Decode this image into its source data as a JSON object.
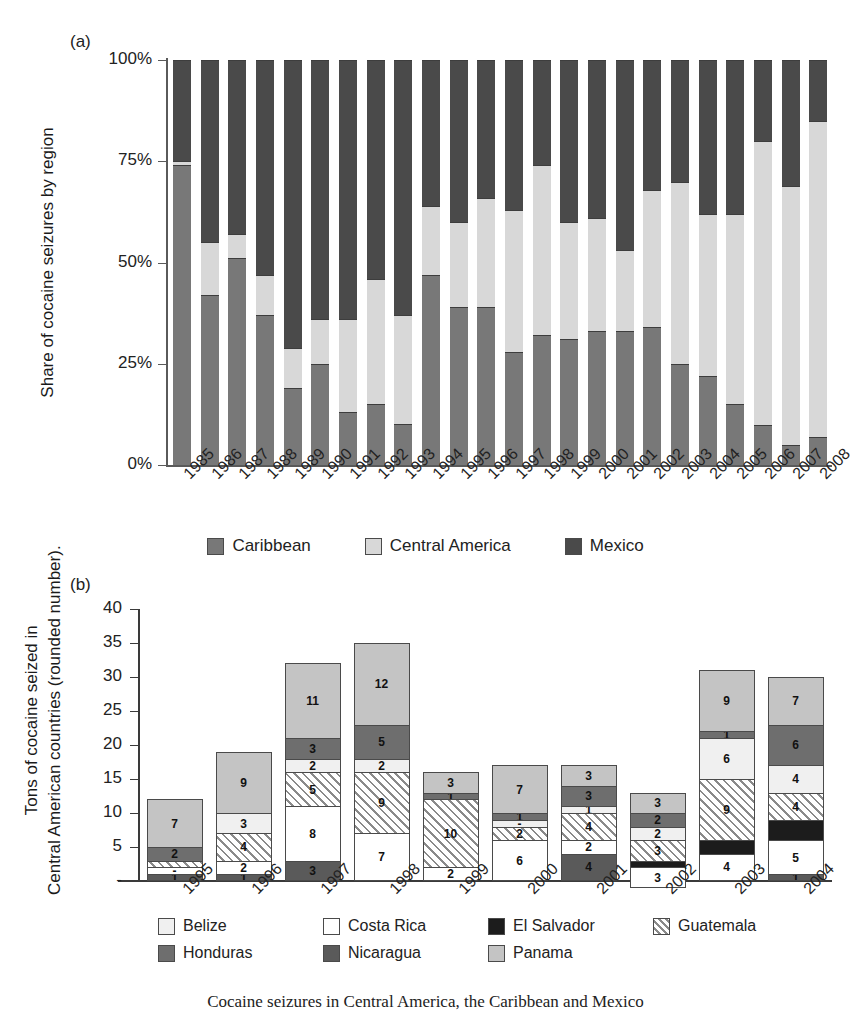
{
  "panel_a": {
    "letter": "(a)",
    "ylabel": "Share of cocaine seizures by region",
    "yticks": [
      "100%",
      "75%",
      "50%",
      "25%",
      "0%"
    ],
    "legend": [
      {
        "label": "Caribbean",
        "color": "#787878"
      },
      {
        "label": "Central America",
        "color": "#d8d8d8"
      },
      {
        "label": "Mexico",
        "color": "#4a4a4a"
      }
    ]
  },
  "panel_b": {
    "letter": "(b)",
    "ylabel_line1": "Tons of cocaine seized in",
    "ylabel_line2": "Central American countries (rounded number).",
    "yticks": [
      "40",
      "35",
      "30",
      "25",
      "20",
      "15",
      "10",
      "5",
      "-"
    ],
    "legend_row1": [
      {
        "label": "Belize",
        "color": "#f0f0f0"
      },
      {
        "label": "Costa Rica",
        "color": "#ffffff"
      },
      {
        "label": "El Salvador",
        "color": "#1c1c1c"
      },
      {
        "label": "Guatemala",
        "color": "hatch"
      }
    ],
    "legend_row2": [
      {
        "label": "Honduras",
        "color": "#6e6e6e"
      },
      {
        "label": "Nicaragua",
        "color": "#5a5a5a"
      },
      {
        "label": "Panama",
        "color": "#c4c4c4"
      }
    ]
  },
  "caption": "Cocaine seizures in Central America, the Caribbean and Mexico",
  "chart_data": [
    {
      "type": "bar",
      "id": "panel-a",
      "stacked": true,
      "normalized": true,
      "title": "Share of cocaine seizures by region",
      "xlabel": "",
      "ylabel": "Share of cocaine seizures by region",
      "ylim": [
        0,
        100
      ],
      "ytick_values": [
        0,
        25,
        50,
        75,
        100
      ],
      "grid": false,
      "legend_position": "bottom",
      "categories": [
        "1985",
        "1986",
        "1987",
        "1988",
        "1989",
        "1990",
        "1991",
        "1992",
        "1993",
        "1994",
        "1995",
        "1996",
        "1997",
        "1998",
        "1999",
        "2000",
        "2001",
        "2002",
        "2003",
        "2004",
        "2005",
        "2006",
        "2007",
        "2008"
      ],
      "series": [
        {
          "name": "Caribbean",
          "color": "#787878",
          "values": [
            74,
            42,
            51,
            37,
            19,
            25,
            13,
            15,
            10,
            47,
            39,
            39,
            28,
            32,
            31,
            33,
            33,
            34,
            25,
            22,
            15,
            10,
            5,
            7
          ]
        },
        {
          "name": "Central America",
          "color": "#d8d8d8",
          "values": [
            1,
            13,
            6,
            10,
            10,
            11,
            23,
            31,
            27,
            17,
            21,
            27,
            35,
            42,
            29,
            28,
            20,
            34,
            45,
            40,
            47,
            70,
            64,
            78
          ]
        },
        {
          "name": "Mexico",
          "color": "#4a4a4a",
          "values": [
            25,
            45,
            43,
            53,
            71,
            64,
            64,
            54,
            63,
            36,
            40,
            34,
            37,
            26,
            40,
            39,
            47,
            32,
            30,
            38,
            38,
            20,
            31,
            15
          ]
        }
      ]
    },
    {
      "type": "bar",
      "id": "panel-b",
      "stacked": true,
      "normalized": false,
      "title": "Tons of cocaine seized in Central American countries (rounded number).",
      "xlabel": "",
      "ylabel": "Tons of cocaine seized in Central American countries (rounded number).",
      "ylim": [
        0,
        40
      ],
      "ytick_values": [
        0,
        5,
        10,
        15,
        20,
        25,
        30,
        35,
        40
      ],
      "grid": false,
      "legend_position": "bottom",
      "categories": [
        "1995",
        "1996",
        "1997",
        "1998",
        "1999",
        "2000",
        "2001",
        "2002",
        "2003",
        "2004"
      ],
      "totals": [
        12,
        19,
        32,
        35,
        16,
        17,
        17,
        13,
        31,
        30
      ],
      "series": [
        {
          "name": "Nicaragua",
          "color": "#5a5a5a",
          "values": [
            1,
            1,
            3,
            0,
            0,
            0,
            4,
            0,
            0,
            1
          ],
          "labels": [
            "1",
            "1",
            "3",
            "",
            "",
            "",
            "4",
            "",
            "",
            "1"
          ]
        },
        {
          "name": "Costa Rica",
          "color": "#ffffff",
          "values": [
            1,
            2,
            8,
            7,
            2,
            6,
            2,
            3,
            4,
            5
          ],
          "labels": [
            "-",
            "2",
            "8",
            "7",
            "2",
            "6",
            "2",
            "3",
            "4",
            "5"
          ]
        },
        {
          "name": "El Salvador",
          "color": "#1c1c1c",
          "values": [
            0,
            0,
            0,
            0,
            0,
            0,
            0,
            1,
            2,
            3
          ],
          "labels": [
            "",
            "",
            "",
            "",
            "",
            "",
            "",
            "",
            "",
            ""
          ]
        },
        {
          "name": "Guatemala",
          "color": "hatch",
          "values": [
            1,
            4,
            5,
            9,
            10,
            2,
            4,
            3,
            9,
            4
          ],
          "labels": [
            "",
            "4",
            "5",
            "9",
            "10",
            "2",
            "4",
            "3",
            "9",
            "4"
          ]
        },
        {
          "name": "Belize",
          "color": "#f0f0f0",
          "values": [
            0,
            3,
            2,
            2,
            0,
            1,
            1,
            2,
            6,
            4
          ],
          "labels": [
            "",
            "3",
            "2",
            "2",
            "",
            "-",
            "1",
            "2",
            "6",
            "4"
          ]
        },
        {
          "name": "Honduras",
          "color": "#6e6e6e",
          "values": [
            2,
            0,
            3,
            5,
            1,
            1,
            3,
            2,
            1,
            6
          ],
          "labels": [
            "2",
            "",
            "3",
            "5",
            "1",
            "1",
            "3",
            "2",
            "1",
            "6"
          ]
        },
        {
          "name": "Panama",
          "color": "#c4c4c4",
          "values": [
            7,
            9,
            11,
            12,
            3,
            7,
            3,
            3,
            9,
            7
          ],
          "labels": [
            "7",
            "9",
            "11",
            "12",
            "3",
            "7",
            "3",
            "3",
            "9",
            "7"
          ]
        }
      ]
    }
  ]
}
